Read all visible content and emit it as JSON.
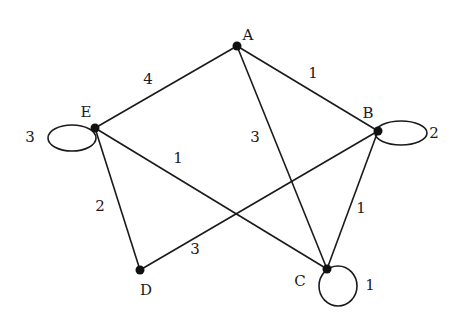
{
  "diagram": {
    "type": "weighted-undirected-graph",
    "nodes": [
      {
        "id": "A",
        "label": "A",
        "x": 237,
        "y": 46,
        "lx": 248,
        "ly": 40
      },
      {
        "id": "B",
        "label": "B",
        "x": 378,
        "y": 131,
        "lx": 368,
        "ly": 118
      },
      {
        "id": "C",
        "label": "C",
        "x": 327,
        "y": 269,
        "lx": 300,
        "ly": 286
      },
      {
        "id": "D",
        "label": "D",
        "x": 140,
        "y": 270,
        "lx": 146,
        "ly": 295
      },
      {
        "id": "E",
        "label": "E",
        "x": 95,
        "y": 128,
        "lx": 86,
        "ly": 117
      }
    ],
    "edges": [
      {
        "from": "E",
        "to": "A",
        "weight": "4",
        "wx": 148,
        "wy": 84
      },
      {
        "from": "A",
        "to": "B",
        "weight": "1",
        "wx": 313,
        "wy": 78
      },
      {
        "from": "A",
        "to": "C",
        "weight": "3",
        "wx": 255,
        "wy": 142
      },
      {
        "from": "E",
        "to": "C",
        "weight": "1",
        "wx": 178,
        "wy": 163
      },
      {
        "from": "E",
        "to": "D",
        "weight": "2",
        "wx": 100,
        "wy": 211
      },
      {
        "from": "D",
        "to": "B",
        "weight": "3",
        "wx": 195,
        "wy": 254
      },
      {
        "from": "B",
        "to": "C",
        "weight": "1",
        "wx": 361,
        "wy": 213
      }
    ],
    "loops": [
      {
        "node": "E",
        "weight": "3",
        "cx": 72,
        "cy": 138,
        "rx": 24,
        "ry": 13,
        "wx": 30,
        "wy": 142
      },
      {
        "node": "B",
        "weight": "2",
        "cx": 401,
        "cy": 133,
        "rx": 26,
        "ry": 12,
        "wx": 434,
        "wy": 138
      },
      {
        "node": "C",
        "weight": "1",
        "cx": 338,
        "cy": 286,
        "rx": 19,
        "ry": 20,
        "wx": 370,
        "wy": 290
      }
    ]
  }
}
